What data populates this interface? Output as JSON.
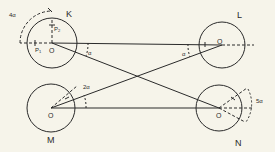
{
  "circles": {
    "K": {
      "label": "K",
      "center_label": "O"
    },
    "L": {
      "label": "L",
      "center_label": "O"
    },
    "M": {
      "label": "M",
      "center_label": "O"
    },
    "N": {
      "label": "N",
      "center_label": "O"
    }
  },
  "angles": {
    "a1": "α",
    "a2": "α",
    "k_arc": "4α",
    "m_arc": "2α",
    "n_arc": "5α"
  },
  "points": {
    "p1": "P",
    "p1_sub": "1",
    "p2": "P",
    "p2_sub": "2"
  }
}
